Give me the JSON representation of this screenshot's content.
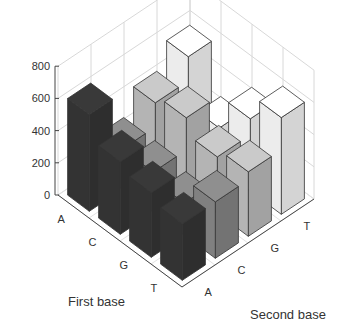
{
  "chart_data": {
    "type": "bar3d",
    "title": "",
    "xlabel": "First base",
    "ylabel": "Second base",
    "zlabel": "",
    "x_categories": [
      "A",
      "C",
      "G",
      "T"
    ],
    "y_categories": [
      "A",
      "C",
      "G",
      "T"
    ],
    "z_ticks": [
      0,
      200,
      400,
      600,
      800
    ],
    "zlim": [
      0,
      800
    ],
    "grid": true,
    "series": [
      {
        "name": "A",
        "color": "#333333",
        "values": [
          600,
          450,
          400,
          350
        ]
      },
      {
        "name": "C",
        "color": "#808080",
        "values": [
          250,
          250,
          200,
          350
        ]
      },
      {
        "name": "G",
        "color": "#b4b4b4",
        "values": [
          400,
          450,
          350,
          400
        ]
      },
      {
        "name": "T",
        "color": "#ececec",
        "values": [
          550,
          250,
          450,
          600
        ]
      }
    ]
  }
}
